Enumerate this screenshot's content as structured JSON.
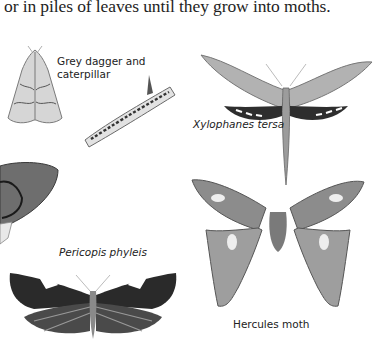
{
  "page": {
    "body_text": "or in piles of leaves until they grow into moths."
  },
  "illustrations": [
    {
      "id": "grey-dagger",
      "label_line1": "Grey dagger and",
      "label_line2": "caterpillar",
      "italic": false
    },
    {
      "id": "xylophanes-tersa",
      "label": "Xylophanes tersa",
      "italic": true
    },
    {
      "id": "pericopis-phyleis",
      "label": "Pericopis phyleis",
      "italic": true
    },
    {
      "id": "hercules-moth",
      "label": "Hercules moth",
      "italic": false
    },
    {
      "id": "partial-moth-left",
      "label": ""
    }
  ],
  "colors": {
    "paper": "#ffffff",
    "ink": "#1e1e1e",
    "moth_dark": "#2e2e2e",
    "moth_mid": "#8a8a8a",
    "moth_light": "#c4c4c4"
  }
}
